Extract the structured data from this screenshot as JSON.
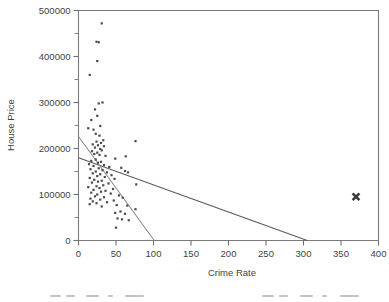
{
  "figure": {
    "background": "#ffffff",
    "axis_color": "#7a7a7a",
    "point_color": "#4a4a4a",
    "fit_line_color": "#5b5b5b",
    "secondary_fit_color": "#8a8a8a",
    "outlier_color": "#3a3a3a"
  },
  "chart_data": {
    "type": "scatter",
    "title": "",
    "xlabel": "Crime Rate",
    "ylabel": "House Price",
    "xlim": [
      0,
      400
    ],
    "ylim": [
      0,
      500000
    ],
    "xticks": [
      0,
      50,
      100,
      150,
      200,
      250,
      300,
      350,
      400
    ],
    "xtick_labels": [
      "0",
      "50",
      "100",
      "150",
      "200",
      "250",
      "300",
      "350",
      "400"
    ],
    "yticks": [
      0,
      100000,
      200000,
      300000,
      400000,
      500000
    ],
    "ytick_labels": [
      "0",
      "100000",
      "200000",
      "300000",
      "400000",
      "500000"
    ],
    "yminor_ticks": [
      50000,
      150000,
      250000,
      350000,
      450000
    ],
    "grid": false,
    "legend": null,
    "series": [
      {
        "name": "House Price vs Crime Rate",
        "marker": "dot",
        "color": "#4a4a4a",
        "points": [
          [
            31,
            472000
          ],
          [
            24,
            432000
          ],
          [
            27,
            431000
          ],
          [
            25,
            390000
          ],
          [
            15,
            360000
          ],
          [
            32,
            300000
          ],
          [
            27,
            298000
          ],
          [
            22,
            285000
          ],
          [
            25,
            271000
          ],
          [
            17,
            262000
          ],
          [
            29,
            249000
          ],
          [
            13,
            244000
          ],
          [
            20,
            241000
          ],
          [
            23,
            232000
          ],
          [
            28,
            228000
          ],
          [
            33,
            218000
          ],
          [
            24,
            215000
          ],
          [
            30,
            212000
          ],
          [
            19,
            209000
          ],
          [
            26,
            207000
          ],
          [
            34,
            205000
          ],
          [
            22,
            202000
          ],
          [
            29,
            199000
          ],
          [
            31,
            196000
          ],
          [
            18,
            194000
          ],
          [
            25,
            191000
          ],
          [
            21,
            188000
          ],
          [
            28,
            186000
          ],
          [
            36,
            184000
          ],
          [
            63,
            183000
          ],
          [
            76,
            216000
          ],
          [
            49,
            178000
          ],
          [
            23,
            176000
          ],
          [
            17,
            173000
          ],
          [
            30,
            171000
          ],
          [
            26,
            169000
          ],
          [
            14,
            166000
          ],
          [
            34,
            164000
          ],
          [
            20,
            162000
          ],
          [
            41,
            160000
          ],
          [
            57,
            158000
          ],
          [
            62,
            151000
          ],
          [
            66,
            148000
          ],
          [
            27,
            157000
          ],
          [
            16,
            155000
          ],
          [
            32,
            153000
          ],
          [
            23,
            150000
          ],
          [
            38,
            148000
          ],
          [
            19,
            146000
          ],
          [
            29,
            144000
          ],
          [
            44,
            142000
          ],
          [
            25,
            140000
          ],
          [
            35,
            138000
          ],
          [
            15,
            136000
          ],
          [
            48,
            134000
          ],
          [
            21,
            132000
          ],
          [
            31,
            130000
          ],
          [
            26,
            128000
          ],
          [
            18,
            126000
          ],
          [
            40,
            124000
          ],
          [
            77,
            122000
          ],
          [
            33,
            120000
          ],
          [
            24,
            118000
          ],
          [
            13,
            116000
          ],
          [
            28,
            114000
          ],
          [
            46,
            112000
          ],
          [
            20,
            110000
          ],
          [
            36,
            108000
          ],
          [
            30,
            106000
          ],
          [
            17,
            104000
          ],
          [
            43,
            102000
          ],
          [
            25,
            100000
          ],
          [
            54,
            98000
          ],
          [
            22,
            96000
          ],
          [
            34,
            94000
          ],
          [
            59,
            93000
          ],
          [
            16,
            91000
          ],
          [
            29,
            89000
          ],
          [
            47,
            87000
          ],
          [
            19,
            85000
          ],
          [
            38,
            83000
          ],
          [
            24,
            81000
          ],
          [
            15,
            79000
          ],
          [
            51,
            77000
          ],
          [
            65,
            76000
          ],
          [
            31,
            74000
          ],
          [
            76,
            68000
          ],
          [
            56,
            63000
          ],
          [
            49,
            60000
          ],
          [
            62,
            58000
          ],
          [
            52,
            48000
          ],
          [
            58,
            46000
          ],
          [
            67,
            44000
          ],
          [
            50,
            28000
          ]
        ]
      },
      {
        "name": "Outlier",
        "marker": "x",
        "color": "#3a3a3a",
        "points": [
          [
            370,
            95000
          ]
        ]
      }
    ],
    "fit_lines": [
      {
        "name": "fit-with-outlier",
        "color": "#5b5b5b",
        "x0": 0,
        "y0": 180000,
        "x1": 305,
        "y1": 0
      },
      {
        "name": "fit-without-outlier",
        "color": "#8a8a8a",
        "x0": 0,
        "y0": 226000,
        "x1": 101,
        "y1": 0
      }
    ]
  }
}
